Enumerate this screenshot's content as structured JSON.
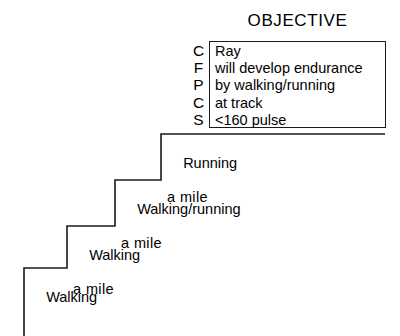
{
  "diagram": {
    "title": "OBJECTIVE",
    "steps": [
      {
        "line1": "Walking",
        "line2": ""
      },
      {
        "line1": "Walking",
        "line2": "a mile"
      },
      {
        "line1": "Walking/running",
        "line2": "a mile"
      },
      {
        "line1": "Running",
        "line2": "a mile"
      }
    ],
    "objective": {
      "prefix_letters": [
        "C",
        "F",
        "P",
        "C",
        "S"
      ],
      "lines": [
        "Ray",
        "will develop endurance",
        "by walking/running",
        "at track",
        "<160 pulse"
      ]
    },
    "colors": {
      "background": "#ffffff",
      "line": "#1a1a1a",
      "text": "#000000"
    }
  }
}
